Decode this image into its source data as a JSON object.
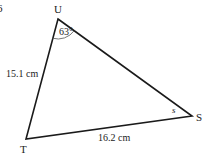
{
  "diagram": {
    "type": "triangle",
    "vertices": [
      {
        "name": "U",
        "x": 58,
        "y": 19
      },
      {
        "name": "S",
        "x": 192,
        "y": 116
      },
      {
        "name": "T",
        "x": 26,
        "y": 139
      }
    ],
    "labels": {
      "vertex_u": "U",
      "vertex_s": "S",
      "vertex_t": "T",
      "angle_u": "63°",
      "angle_s": "s",
      "side_ut": "15.1 cm",
      "side_ts": "16.2 cm"
    },
    "corner_fragment": "6",
    "stroke_color": "#1a1a1a"
  }
}
